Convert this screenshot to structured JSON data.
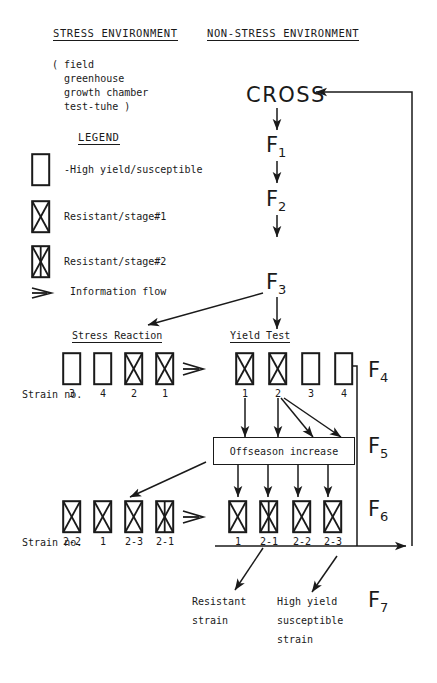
{
  "headers": {
    "stress": "STRESS ENVIRONMENT",
    "nonstress": "NON-STRESS ENVIRONMENT"
  },
  "environment_list": "( field\n  greenhouse\n  growth chamber\n  test-tuhe )",
  "legend": {
    "title": "LEGEND",
    "items": [
      {
        "symbol": "empty-box",
        "label": "-High yield/susceptible"
      },
      {
        "symbol": "x-box",
        "label": "Resistant/stage#1"
      },
      {
        "symbol": "double-x-box",
        "label": "Resistant/stage#2"
      },
      {
        "symbol": "open-arrow",
        "label": "Information flow"
      }
    ]
  },
  "pedigree": {
    "cross": "CROSS",
    "f1": "F",
    "f1_sub": "1",
    "f2": "F",
    "f2_sub": "2",
    "f3": "F",
    "f3_sub": "3"
  },
  "generation_labels": [
    {
      "letter": "F",
      "sub": "4"
    },
    {
      "letter": "F",
      "sub": "5"
    },
    {
      "letter": "F",
      "sub": "6"
    },
    {
      "letter": "F",
      "sub": "7"
    }
  ],
  "columns": {
    "stress_reaction": "Stress Reaction",
    "yield_test": "Yield Test"
  },
  "strain_label": "Strain no.",
  "strain_label_f6": "Strain no.",
  "rows": {
    "f4": {
      "stress_reaction": [
        {
          "number": "3",
          "type": "empty-box"
        },
        {
          "number": "4",
          "type": "empty-box"
        },
        {
          "number": "2",
          "type": "x-box"
        },
        {
          "number": "1",
          "type": "x-box"
        }
      ],
      "yield_test": [
        {
          "number": "1",
          "type": "x-box"
        },
        {
          "number": "2",
          "type": "x-box"
        },
        {
          "number": "3",
          "type": "empty-box"
        },
        {
          "number": "4",
          "type": "empty-box"
        }
      ]
    },
    "f6": {
      "stress_reaction": [
        {
          "number": "2-2",
          "type": "x-box"
        },
        {
          "number": "1",
          "type": "x-box"
        },
        {
          "number": "2-3",
          "type": "x-box"
        },
        {
          "number": "2-1",
          "type": "double-x-box"
        }
      ],
      "yield_test": [
        {
          "number": "1",
          "type": "x-box"
        },
        {
          "number": "2-1",
          "type": "double-x-box"
        },
        {
          "number": "2-2",
          "type": "x-box"
        },
        {
          "number": "2-3",
          "type": "x-box"
        }
      ]
    }
  },
  "offseason": "Offseason increase",
  "outcomes": [
    {
      "lines": [
        "Resistant",
        "strain"
      ]
    },
    {
      "lines": [
        "High yield",
        "susceptible",
        "strain"
      ]
    }
  ],
  "colors": {
    "ink": "#1a1a1a",
    "paper": "#ffffff"
  }
}
